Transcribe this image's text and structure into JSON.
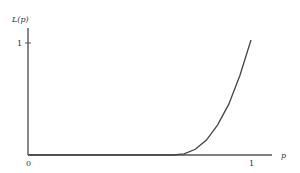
{
  "chart_data": {
    "type": "line",
    "title": "",
    "xlabel": "p",
    "ylabel": "L(p)",
    "xlim": [
      0,
      1
    ],
    "ylim": [
      0,
      1
    ],
    "x_ticks": [
      "0",
      "1"
    ],
    "y_ticks": [
      "1"
    ],
    "grid": false,
    "legend": null,
    "series": [
      {
        "name": "L(p)",
        "x": [
          0.0,
          0.1,
          0.2,
          0.3,
          0.4,
          0.5,
          0.6,
          0.65,
          0.7,
          0.75,
          0.8,
          0.85,
          0.9,
          0.95,
          1.0
        ],
        "y": [
          0.0,
          0.0,
          0.0,
          0.0,
          0.0,
          0.0,
          0.0,
          0.0,
          0.01,
          0.05,
          0.13,
          0.26,
          0.44,
          0.69,
          1.0
        ]
      }
    ]
  },
  "labels": {
    "y_axis": "L(p)",
    "x_axis": "p",
    "origin": "0",
    "x_one": "1",
    "y_one": "1"
  }
}
